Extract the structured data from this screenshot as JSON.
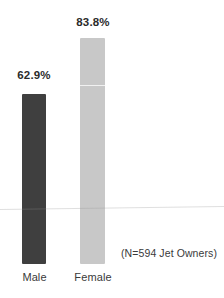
{
  "chart_data": {
    "type": "bar",
    "title": "",
    "subtitle": "",
    "xlabel": "",
    "ylabel": "",
    "categories": [
      "Male",
      "Female"
    ],
    "values": [
      62.9,
      83.8
    ],
    "value_labels": [
      "62.9%",
      "83.8%"
    ],
    "ylim": [
      0,
      100
    ],
    "grid": false,
    "legend": null,
    "annotations": [
      "(N=594 Jet Owners)"
    ],
    "series": [
      {
        "name": "Percent",
        "values": [
          62.9,
          83.8
        ]
      }
    ],
    "colors": {
      "male_bar": "#3f3f3f",
      "female_bar": "#c8c8c8",
      "label_text": "#2b2b2b",
      "axis_text": "#3a3a3a",
      "background": "#ffffff"
    }
  },
  "labels": {
    "value_male": "62.9%",
    "value_female": "83.8%",
    "category_male": "Male",
    "category_female": "Female",
    "sample_note": "(N=594 Jet Owners)"
  }
}
